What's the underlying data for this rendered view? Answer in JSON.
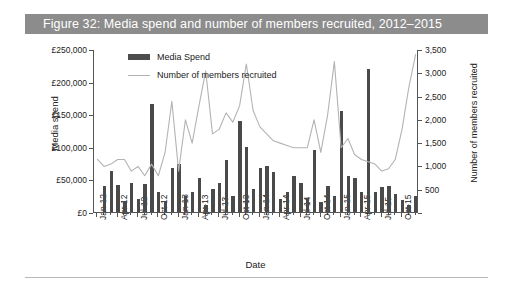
{
  "figure": {
    "title": "Figure 32: Media spend and number of members recruited, 2012–2015",
    "banner_color": "#8c8c8c",
    "title_color": "#ffffff"
  },
  "legend": {
    "position": "top-left-inside",
    "items": [
      {
        "label": "Media Spend",
        "marker": "bar-swatch",
        "color": "#4d4d4d"
      },
      {
        "label": "Number of members recruited",
        "marker": "line-swatch",
        "color": "#b3b3b3"
      }
    ]
  },
  "axes": {
    "y_left": {
      "label": "Media spend",
      "ticks": [
        "£0",
        "£50,000",
        "£100,000",
        "£150,000",
        "£200,000",
        "£250,000"
      ],
      "min": 0,
      "max": 250000,
      "step": 50000
    },
    "y_right": {
      "label": "Number of members recruited",
      "ticks": [
        "",
        "500",
        "1,000",
        "1,500",
        "2,000",
        "2,500",
        "3,000",
        "3,500"
      ],
      "min": 0,
      "max": 3500,
      "step": 500
    },
    "x": {
      "label": "Date",
      "ticks": [
        "Jan-12",
        "Apr-12",
        "Jul-12",
        "Oct-12",
        "Jan-13",
        "Apr-13",
        "Jul-13",
        "Oct-13",
        "Jan-14",
        "Apr-14",
        "Jul-14",
        "Oct-14",
        "Jan-15",
        "Apr-15",
        "Jul-15",
        "Oct-15"
      ]
    }
  },
  "chart_data": {
    "type": "bar",
    "title": "Figure 32: Media spend and number of members recruited, 2012–2015",
    "xlabel": "Date",
    "ylabel": "Media spend",
    "ylabel_secondary": "Number of members recruited",
    "ylim": [
      0,
      250000
    ],
    "ylim_secondary": [
      0,
      3500
    ],
    "grid": false,
    "legend_position": "upper left",
    "categories": [
      "Jan-12",
      "Feb-12",
      "Mar-12",
      "Apr-12",
      "May-12",
      "Jun-12",
      "Jul-12",
      "Aug-12",
      "Sep-12",
      "Oct-12",
      "Nov-12",
      "Dec-12",
      "Jan-13",
      "Feb-13",
      "Mar-13",
      "Apr-13",
      "May-13",
      "Jun-13",
      "Jul-13",
      "Aug-13",
      "Sep-13",
      "Oct-13",
      "Nov-13",
      "Dec-13",
      "Jan-14",
      "Feb-14",
      "Mar-14",
      "Apr-14",
      "May-14",
      "Jun-14",
      "Jul-14",
      "Aug-14",
      "Sep-14",
      "Oct-14",
      "Nov-14",
      "Dec-14",
      "Jan-15",
      "Feb-15",
      "Mar-15",
      "Apr-15",
      "May-15",
      "Jun-15",
      "Jul-15",
      "Aug-15",
      "Sep-15",
      "Oct-15",
      "Nov-15",
      "Dec-15"
    ],
    "series": [
      {
        "name": "Media Spend",
        "axis": "left",
        "type": "bar",
        "color": "#4a4a4a",
        "unit": "GBP",
        "values": [
          0,
          40000,
          63000,
          42000,
          16000,
          45000,
          20000,
          43000,
          165000,
          30000,
          15000,
          68000,
          74000,
          25000,
          30000,
          52000,
          10000,
          35000,
          45000,
          80000,
          25000,
          140000,
          100000,
          35000,
          68000,
          70000,
          62000,
          20000,
          30000,
          55000,
          45000,
          22000,
          95000,
          15000,
          40000,
          25000,
          155000,
          55000,
          52000,
          30000,
          220000,
          30000,
          38000,
          40000,
          28000,
          18000,
          10000,
          25000
        ]
      },
      {
        "name": "Number of members recruited",
        "axis": "right",
        "type": "line",
        "color": "#b3b3b3",
        "values": [
          1150,
          1000,
          1050,
          1150,
          1150,
          900,
          1000,
          800,
          1050,
          800,
          1300,
          2400,
          900,
          2000,
          1500,
          2300,
          3050,
          1700,
          1800,
          2150,
          1950,
          2300,
          3200,
          2200,
          1850,
          1700,
          1550,
          1500,
          1450,
          1400,
          1400,
          1400,
          2000,
          1300,
          2100,
          3250,
          1400,
          1600,
          1250,
          1150,
          1100,
          1050,
          900,
          950,
          1150,
          1800,
          2700,
          3400
        ]
      }
    ]
  }
}
